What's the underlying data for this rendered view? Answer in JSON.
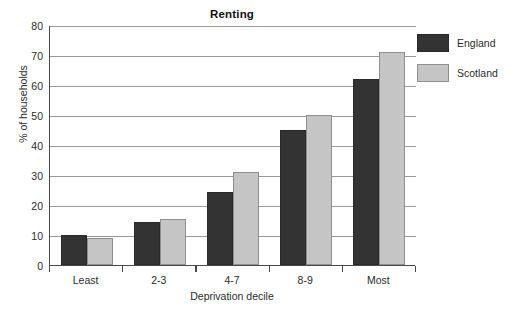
{
  "chart_data": {
    "type": "bar",
    "title": "Renting",
    "xlabel": "Deprivation decile",
    "ylabel": "% of households",
    "categories": [
      "Least",
      "2-3",
      "4-7",
      "8-9",
      "Most"
    ],
    "series": [
      {
        "name": "England",
        "color": "#333333",
        "values": [
          10,
          14.5,
          24.5,
          45,
          62
        ]
      },
      {
        "name": "Scotland",
        "color": "#c5c5c5",
        "values": [
          9,
          15.5,
          31,
          50,
          71
        ]
      }
    ],
    "ylim": [
      0,
      80
    ],
    "yticks": [
      0,
      10,
      20,
      30,
      40,
      50,
      60,
      70,
      80
    ],
    "ytick_labels": [
      "0",
      "10",
      "20",
      "30",
      "40",
      "50",
      "60",
      "70",
      "80"
    ],
    "grid": true,
    "legend_position": "right"
  }
}
